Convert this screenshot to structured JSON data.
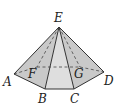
{
  "figure": {
    "type": "pyramid",
    "points": {
      "E": {
        "x": 59,
        "y": 27
      },
      "A": {
        "x": 14,
        "y": 74
      },
      "B": {
        "x": 45,
        "y": 89
      },
      "C": {
        "x": 74,
        "y": 89
      },
      "D": {
        "x": 104,
        "y": 72
      },
      "F": {
        "x": 37,
        "y": 67
      },
      "G": {
        "x": 80,
        "y": 67
      }
    },
    "labels": [
      {
        "text": "E",
        "x": 54,
        "y": 22
      },
      {
        "text": "A",
        "x": 3,
        "y": 86
      },
      {
        "text": "B",
        "x": 38,
        "y": 103
      },
      {
        "text": "C",
        "x": 70,
        "y": 103
      },
      {
        "text": "D",
        "x": 104,
        "y": 85
      },
      {
        "text": "F",
        "x": 28,
        "y": 78
      },
      {
        "text": "G",
        "x": 74,
        "y": 78
      }
    ],
    "colors": {
      "side_face": "#c9c9c9",
      "front_face": "#dedede",
      "stroke": "#333333",
      "hidden_stroke": "#555555"
    }
  }
}
